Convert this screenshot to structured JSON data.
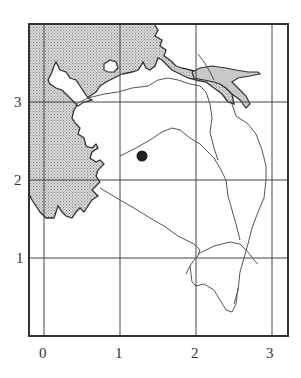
{
  "map": {
    "type": "grid-map",
    "description": "Coastline map with grid and point marker",
    "colors": {
      "frame": "#333333",
      "grid": "#444444",
      "land_shading": "#c8c8c8",
      "coast": "#333333",
      "road": "#555555",
      "marker": "#222222"
    },
    "x_axis": {
      "ticks": [
        "0",
        "1",
        "2",
        "3"
      ]
    },
    "y_axis": {
      "ticks": [
        "3",
        "2",
        "1"
      ]
    },
    "marker": {
      "label": "location-marker",
      "grid_x": 1.3,
      "grid_y": 2.3
    }
  }
}
